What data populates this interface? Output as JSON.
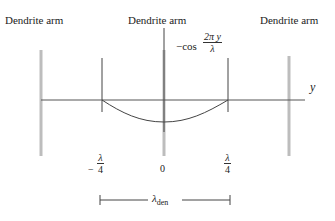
{
  "diagram": {
    "labels": {
      "left_arm": "Dendrite arm",
      "center_arm": "Dendrite arm",
      "right_arm": "Dendrite arm",
      "axis_y": "y"
    },
    "function": {
      "prefix": "−cos",
      "numerator": "2π y",
      "denominator": "λ"
    },
    "ticks": {
      "left": {
        "sign": "−",
        "numerator": "λ",
        "denominator": "4"
      },
      "center": "0",
      "right": {
        "numerator": "λ",
        "denominator": "4"
      }
    },
    "dimension": {
      "symbol": "λ",
      "subscript": "den"
    },
    "colors": {
      "arm_gray": "#b8b8b8",
      "line_dark": "#444444",
      "axis": "#555555"
    }
  }
}
